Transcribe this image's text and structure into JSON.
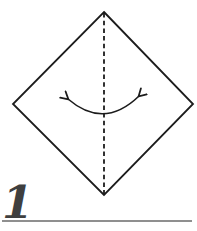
{
  "step": {
    "number": "1"
  },
  "diagram": {
    "paper": "square-rotated-45deg-diamond",
    "fold_line": "vertical-center-dashed-valley-fold",
    "arrow": "curved-double-headed-fold-unfold-arrow"
  },
  "colors": {
    "background": "#ffffff",
    "line": "#1c1c1c",
    "step_number": "#3f3f3f",
    "rule": "#8f8f8f"
  }
}
